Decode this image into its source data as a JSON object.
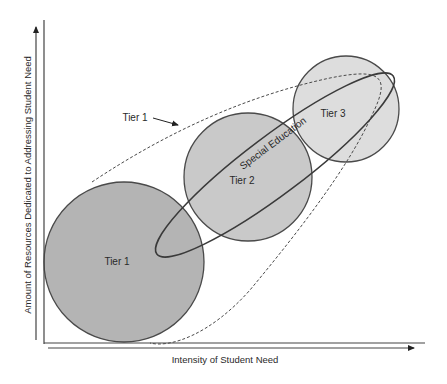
{
  "diagram": {
    "type": "venn-overlap",
    "axes": {
      "x_label": "Intensity of Student Need",
      "y_label": "Amount of Resources Dedicated to Addressing Student Need"
    },
    "circles": [
      {
        "label": "Tier 1",
        "fill": "#b4b4b4"
      },
      {
        "label": "Tier 2",
        "fill": "#c9c9c9"
      },
      {
        "label": "Tier 3",
        "fill": "#dddddd"
      }
    ],
    "ellipse": {
      "label": "Special Education"
    },
    "envelope": {
      "label": "Tier 1",
      "style": "dashed"
    },
    "stroke_color": "#4a4a4a"
  }
}
